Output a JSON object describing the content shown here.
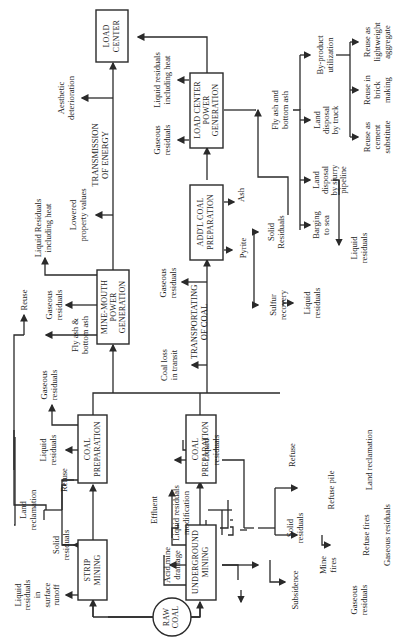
{
  "colors": {
    "line": "#2a2a2a",
    "text": "#1e1e1e",
    "background": "#ffffff"
  },
  "orientation": "rotated 90° counter-clockwise",
  "nodes": {
    "raw_coal": [
      "RAW",
      "COAL"
    ],
    "strip_mining": [
      "STRIP",
      "MINING"
    ],
    "underground_mining": [
      "UNDERGROUND",
      "MINING"
    ],
    "coal_prep_strip": [
      "COAL",
      "PREPARATION"
    ],
    "coal_prep_underground": [
      "COAL",
      "PREPARATION"
    ],
    "mine_mouth": [
      "MINE-MOUTH",
      "POWER",
      "GENERATION"
    ],
    "addl_coal_prep": [
      "ADD'L COAL",
      "PREPARATION"
    ],
    "load_center_power": [
      "LOAD CENTER",
      "POWER",
      "GENERATION"
    ],
    "load_center": [
      "LOAD",
      "CENTER"
    ]
  },
  "labels": {
    "liquid_runoff": [
      "Liquid",
      "residuals",
      "in",
      "surface",
      "runoff"
    ],
    "solid_residuals_strip": [
      "Solid",
      "residuals"
    ],
    "land_reclamation_strip": [
      "Land",
      "reclamation"
    ],
    "refuse_strip": [
      "Refuse"
    ],
    "liquid_residuals_prep1": [
      "Liquid",
      "residuals"
    ],
    "gaseous_prep1": [
      "Gaseous",
      "residuals"
    ],
    "fly_ash_mm": [
      "Fly ash &",
      "bottom ash"
    ],
    "reuse": [
      "Reuse"
    ],
    "gaseous_mm": [
      "Gaseous",
      "residuals"
    ],
    "liquid_heat_mm": [
      "Liquid Residuals",
      "including heat"
    ],
    "lowered_property": [
      "Lowered",
      "property values"
    ],
    "transmission": [
      "TRANSMISSION",
      "OF ENERGY"
    ],
    "aesthetic": [
      "Aesthetic",
      "deterioration"
    ],
    "coal_loss": [
      "Coal loss",
      "in transit"
    ],
    "transporting": [
      "TRANSPORTATING",
      "OF COAL"
    ],
    "gaseous_transport": [
      "Gaseous",
      "residuals"
    ],
    "effluent": [
      "Effluent"
    ],
    "liquid_mod": [
      "Liquid residuals",
      "modification"
    ],
    "acid_drainage": [
      "Acid mine",
      "drainage"
    ],
    "liquid_residuals_prep2": [
      "Liquid",
      "residuals"
    ],
    "refuse_ug": [
      "Refuse"
    ],
    "solid_residuals_ug": [
      "Solid",
      "residuals"
    ],
    "subsidence": [
      "Subsidence"
    ],
    "mine_fires": [
      "Mine",
      "fires"
    ],
    "gaseous_minefires": [
      "Gaseous",
      "residuals"
    ],
    "refuse_pile": [
      "Refuse pile"
    ],
    "refuse_fires": [
      "Refuse fires"
    ],
    "gaseous_refuse": [
      "Gaseous residuals"
    ],
    "land_reclamation_ug": [
      "Land reclamation"
    ],
    "pyrite": [
      "Pyrite"
    ],
    "sulfur_recovery": [
      "Sulfur",
      "recovery"
    ],
    "liquid_sulfur": [
      "Liquid",
      "residuals"
    ],
    "solid_residuals_addl": [
      "Solid",
      "Residuals"
    ],
    "ash": [
      "Ash"
    ],
    "gaseous_lc": [
      "Gaseous",
      "residuals"
    ],
    "liquid_heat_lc": [
      "Liquid residuals",
      "including heat"
    ],
    "fly_ash_lc": [
      "Fly ash and",
      "bottom ash"
    ],
    "barging": [
      "Barging",
      "to sea"
    ],
    "slurry": [
      "Land",
      "disposal",
      "by slurry",
      "pipeline"
    ],
    "liquid_slurry": [
      "Liquid",
      "residuals"
    ],
    "truck": [
      "Land",
      "disposal",
      "by truck"
    ],
    "byproduct": [
      "By-product",
      "utilization"
    ],
    "cement": [
      "Reuse as",
      "cement",
      "substitute"
    ],
    "brick": [
      "Reuse in",
      "brick",
      "making"
    ],
    "aggregate": [
      "Reuse as",
      "lightweight",
      "aggregate"
    ]
  }
}
